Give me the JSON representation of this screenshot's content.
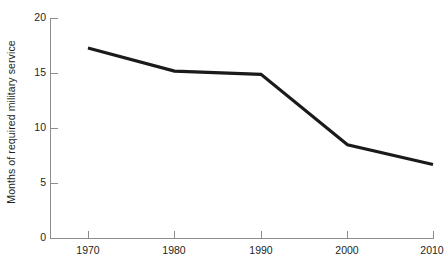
{
  "chart_data": {
    "type": "line",
    "title": "",
    "xlabel": "",
    "ylabel": "Months of required military service",
    "x": [
      1970,
      1980,
      1990,
      2000,
      2010
    ],
    "categories": [
      "1970",
      "1980",
      "1990",
      "2000",
      "2010"
    ],
    "values": [
      17.3,
      15.2,
      14.9,
      8.5,
      6.7
    ],
    "series": [
      {
        "name": "Months of required military service",
        "values": [
          17.3,
          15.2,
          14.9,
          8.5,
          6.7
        ]
      }
    ],
    "xlim": [
      1965,
      1912
    ],
    "ylim": [
      0,
      20
    ],
    "yticks": [
      0,
      5,
      10,
      15,
      20
    ],
    "ytick_labels": [
      "0",
      "5",
      "10",
      "15",
      "20"
    ],
    "xticks": [
      1970,
      1980,
      1990,
      2000,
      2010
    ],
    "xtick_labels": [
      "1970",
      "1980",
      "1990",
      "2000",
      "2010"
    ],
    "grid": false,
    "legend": false,
    "legend_position": "none",
    "line_color": "#1a1a1a",
    "axis_color": "#8c8c8c",
    "background_color": "#ffffff"
  },
  "axes": {
    "y_title": "Months of required military service",
    "y_ticks": [
      {
        "label": "20",
        "value": 20
      },
      {
        "label": "15",
        "value": 15
      },
      {
        "label": "10",
        "value": 10
      },
      {
        "label": "5",
        "value": 5
      },
      {
        "label": "0",
        "value": 0
      }
    ],
    "x_ticks": [
      {
        "label": "1970",
        "value": 1970
      },
      {
        "label": "1980",
        "value": 1980
      },
      {
        "label": "1990",
        "value": 1990
      },
      {
        "label": "2000",
        "value": 2000
      },
      {
        "label": "2010",
        "value": 2010
      }
    ]
  }
}
